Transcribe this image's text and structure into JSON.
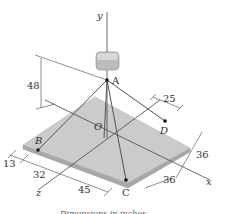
{
  "diagram": {
    "axes": {
      "x": "x",
      "y": "y",
      "z": "z"
    },
    "points": {
      "A": "A",
      "B": "B",
      "C": "C",
      "D": "D",
      "O": "O"
    },
    "dimensions": {
      "height_A": "48",
      "d_25": "25",
      "d_13": "13",
      "d_32": "32",
      "d_45": "45",
      "d_36_right": "36",
      "d_36_front": "36"
    },
    "caption": "Dimensions in inches",
    "colors": {
      "plate_top": "#c9c9c9",
      "plate_edge": "#a8a8a8",
      "line": "#444444",
      "block": "#bdbdbd"
    }
  }
}
